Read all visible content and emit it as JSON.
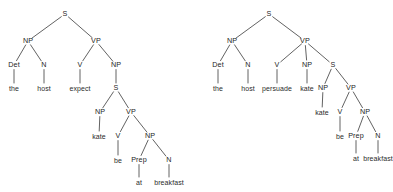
{
  "figure": {
    "type": "syntax-tree-pair",
    "background_color": "#ffffff",
    "line_color": "#3a3a3a",
    "text_color": "#242424"
  },
  "trees": [
    {
      "id": "left-tree",
      "name": "expect-tree",
      "sentence": "the host expect kate be at breakfast",
      "nodes": [
        {
          "id": "L0",
          "label": "S",
          "x": 65,
          "y": 14,
          "kind": "nonterminal"
        },
        {
          "id": "L1",
          "label": "NP",
          "x": 28,
          "y": 41,
          "kind": "nonterminal"
        },
        {
          "id": "L2",
          "label": "VP",
          "x": 96,
          "y": 41,
          "kind": "nonterminal"
        },
        {
          "id": "L3",
          "label": "Det",
          "x": 14,
          "y": 65,
          "kind": "nonterminal"
        },
        {
          "id": "L4",
          "label": "N",
          "x": 44,
          "y": 65,
          "kind": "nonterminal"
        },
        {
          "id": "L5",
          "label": "V",
          "x": 80,
          "y": 65,
          "kind": "nonterminal"
        },
        {
          "id": "L6",
          "label": "NP",
          "x": 116,
          "y": 65,
          "kind": "nonterminal"
        },
        {
          "id": "L7",
          "label": "the",
          "x": 14,
          "y": 88,
          "kind": "terminal"
        },
        {
          "id": "L8",
          "label": "host",
          "x": 44,
          "y": 88,
          "kind": "terminal"
        },
        {
          "id": "L9",
          "label": "expect",
          "x": 80,
          "y": 88,
          "kind": "terminal"
        },
        {
          "id": "L10",
          "label": "S",
          "x": 116,
          "y": 88,
          "kind": "nonterminal"
        },
        {
          "id": "L11",
          "label": "NP",
          "x": 100,
          "y": 112,
          "kind": "nonterminal"
        },
        {
          "id": "L12",
          "label": "VP",
          "x": 131,
          "y": 112,
          "kind": "nonterminal"
        },
        {
          "id": "L13",
          "label": "kate",
          "x": 99,
          "y": 136,
          "kind": "terminal"
        },
        {
          "id": "L14",
          "label": "V",
          "x": 118,
          "y": 136,
          "kind": "nonterminal"
        },
        {
          "id": "L15",
          "label": "NP",
          "x": 150,
          "y": 136,
          "kind": "nonterminal"
        },
        {
          "id": "L16",
          "label": "be",
          "x": 118,
          "y": 160,
          "kind": "terminal"
        },
        {
          "id": "L17",
          "label": "Prep",
          "x": 139,
          "y": 160,
          "kind": "nonterminal"
        },
        {
          "id": "L18",
          "label": "N",
          "x": 169,
          "y": 160,
          "kind": "nonterminal"
        },
        {
          "id": "L19",
          "label": "at",
          "x": 139,
          "y": 182,
          "kind": "terminal"
        },
        {
          "id": "L20",
          "label": "breakfast",
          "x": 169,
          "y": 182,
          "kind": "terminal"
        }
      ],
      "edges": [
        [
          "L0",
          "L1"
        ],
        [
          "L0",
          "L2"
        ],
        [
          "L1",
          "L3"
        ],
        [
          "L1",
          "L4"
        ],
        [
          "L2",
          "L5"
        ],
        [
          "L2",
          "L6"
        ],
        [
          "L3",
          "L7"
        ],
        [
          "L4",
          "L8"
        ],
        [
          "L5",
          "L9"
        ],
        [
          "L6",
          "L10"
        ],
        [
          "L10",
          "L11"
        ],
        [
          "L10",
          "L12"
        ],
        [
          "L11",
          "L13"
        ],
        [
          "L12",
          "L14"
        ],
        [
          "L12",
          "L15"
        ],
        [
          "L14",
          "L16"
        ],
        [
          "L15",
          "L17"
        ],
        [
          "L15",
          "L18"
        ],
        [
          "L17",
          "L19"
        ],
        [
          "L18",
          "L20"
        ]
      ]
    },
    {
      "id": "right-tree",
      "name": "persuade-tree",
      "sentence": "the host persuade kate kate be at breakfast",
      "nodes": [
        {
          "id": "R0",
          "label": "S",
          "x": 269,
          "y": 14,
          "kind": "nonterminal"
        },
        {
          "id": "R1",
          "label": "NP",
          "x": 232,
          "y": 41,
          "kind": "nonterminal"
        },
        {
          "id": "R2",
          "label": "VP",
          "x": 305,
          "y": 41,
          "kind": "nonterminal"
        },
        {
          "id": "R3",
          "label": "Det",
          "x": 218,
          "y": 65,
          "kind": "nonterminal"
        },
        {
          "id": "R4",
          "label": "N",
          "x": 248,
          "y": 65,
          "kind": "nonterminal"
        },
        {
          "id": "R5",
          "label": "V",
          "x": 277,
          "y": 65,
          "kind": "nonterminal"
        },
        {
          "id": "R6",
          "label": "NP",
          "x": 307,
          "y": 65,
          "kind": "nonterminal"
        },
        {
          "id": "R7",
          "label": "S",
          "x": 333,
          "y": 65,
          "kind": "nonterminal"
        },
        {
          "id": "R8",
          "label": "the",
          "x": 218,
          "y": 88,
          "kind": "terminal"
        },
        {
          "id": "R9",
          "label": "host",
          "x": 248,
          "y": 88,
          "kind": "terminal"
        },
        {
          "id": "R10",
          "label": "persuade",
          "x": 277,
          "y": 88,
          "kind": "terminal"
        },
        {
          "id": "R11",
          "label": "kate",
          "x": 307,
          "y": 88,
          "kind": "terminal"
        },
        {
          "id": "R12",
          "label": "NP",
          "x": 323,
          "y": 88,
          "kind": "nonterminal"
        },
        {
          "id": "R13",
          "label": "VP",
          "x": 351,
          "y": 88,
          "kind": "nonterminal"
        },
        {
          "id": "R14",
          "label": "kate",
          "x": 322,
          "y": 112,
          "kind": "terminal"
        },
        {
          "id": "R15",
          "label": "V",
          "x": 340,
          "y": 112,
          "kind": "nonterminal"
        },
        {
          "id": "R16",
          "label": "NP",
          "x": 365,
          "y": 112,
          "kind": "nonterminal"
        },
        {
          "id": "R17",
          "label": "be",
          "x": 340,
          "y": 136,
          "kind": "terminal"
        },
        {
          "id": "R18",
          "label": "Prep",
          "x": 356,
          "y": 136,
          "kind": "nonterminal"
        },
        {
          "id": "R19",
          "label": "N",
          "x": 378,
          "y": 136,
          "kind": "nonterminal"
        },
        {
          "id": "R20",
          "label": "at",
          "x": 356,
          "y": 158,
          "kind": "terminal"
        },
        {
          "id": "R21",
          "label": "breakfast",
          "x": 378,
          "y": 158,
          "kind": "terminal"
        }
      ],
      "edges": [
        [
          "R0",
          "R1"
        ],
        [
          "R0",
          "R2"
        ],
        [
          "R1",
          "R3"
        ],
        [
          "R1",
          "R4"
        ],
        [
          "R2",
          "R5"
        ],
        [
          "R2",
          "R6"
        ],
        [
          "R2",
          "R7"
        ],
        [
          "R3",
          "R8"
        ],
        [
          "R4",
          "R9"
        ],
        [
          "R5",
          "R10"
        ],
        [
          "R6",
          "R11"
        ],
        [
          "R7",
          "R12"
        ],
        [
          "R7",
          "R13"
        ],
        [
          "R12",
          "R14"
        ],
        [
          "R13",
          "R15"
        ],
        [
          "R13",
          "R16"
        ],
        [
          "R15",
          "R17"
        ],
        [
          "R16",
          "R18"
        ],
        [
          "R16",
          "R19"
        ],
        [
          "R18",
          "R20"
        ],
        [
          "R19",
          "R21"
        ]
      ]
    }
  ]
}
